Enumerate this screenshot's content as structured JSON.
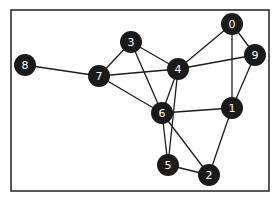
{
  "graph": {
    "frame": {
      "x": 11,
      "y": 10,
      "width": 258,
      "height": 181
    },
    "node_radius": 11,
    "colors": {
      "node_fill": "#1a1a1a",
      "node_label": "#ffffff",
      "edge": "#1c1c1c",
      "frame": "#222222",
      "background": "#ffffff"
    },
    "nodes": [
      {
        "id": "0",
        "label": "0",
        "x": 232,
        "y": 24
      },
      {
        "id": "1",
        "label": "1",
        "x": 232,
        "y": 108
      },
      {
        "id": "2",
        "label": "2",
        "x": 209,
        "y": 175
      },
      {
        "id": "3",
        "label": "3",
        "x": 131,
        "y": 42
      },
      {
        "id": "4",
        "label": "4",
        "x": 178,
        "y": 69
      },
      {
        "id": "5",
        "label": "5",
        "x": 168,
        "y": 165
      },
      {
        "id": "6",
        "label": "6",
        "x": 162,
        "y": 113
      },
      {
        "id": "7",
        "label": "7",
        "x": 99,
        "y": 76
      },
      {
        "id": "8",
        "label": "8",
        "x": 25,
        "y": 65
      },
      {
        "id": "9",
        "label": "9",
        "x": 255,
        "y": 55
      }
    ],
    "edges": [
      [
        "8",
        "7"
      ],
      [
        "7",
        "3"
      ],
      [
        "7",
        "4"
      ],
      [
        "7",
        "6"
      ],
      [
        "3",
        "4"
      ],
      [
        "3",
        "6"
      ],
      [
        "4",
        "0"
      ],
      [
        "4",
        "9"
      ],
      [
        "4",
        "6"
      ],
      [
        "4",
        "5"
      ],
      [
        "0",
        "9"
      ],
      [
        "0",
        "1"
      ],
      [
        "9",
        "1"
      ],
      [
        "6",
        "1"
      ],
      [
        "6",
        "5"
      ],
      [
        "6",
        "2"
      ],
      [
        "5",
        "2"
      ],
      [
        "1",
        "2"
      ]
    ]
  }
}
